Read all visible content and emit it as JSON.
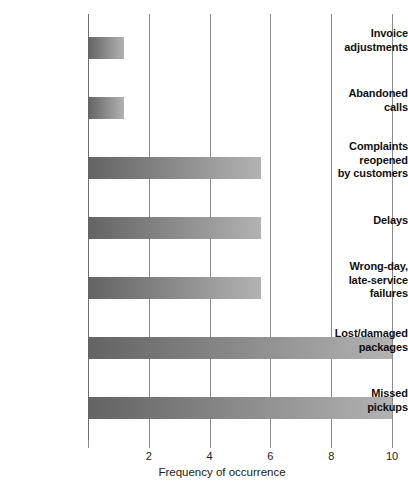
{
  "chart_data": {
    "type": "bar",
    "orientation": "horizontal",
    "title": "",
    "xlabel": "Frequency of occurrence",
    "ylabel": "",
    "xlim": [
      0,
      10
    ],
    "xticks": [
      2,
      4,
      6,
      8,
      10
    ],
    "xtick_labels": [
      "2",
      "4",
      "6",
      "8",
      "10"
    ],
    "grid": "vertical",
    "legend": "none",
    "categories": [
      "Invoice adjustments",
      "Abandoned calls",
      "Complaints reopened by customers",
      "Delays",
      "Wrong-day, late-service failures",
      "Lost/damaged packages",
      "Missed pickups"
    ],
    "category_lines": [
      [
        "Invoice",
        "adjustments"
      ],
      [
        "Abandoned",
        "calls"
      ],
      [
        "Complaints",
        "reopened",
        "by customers"
      ],
      [
        "Delays"
      ],
      [
        "Wrong-day,",
        "late-service",
        "failures"
      ],
      [
        "Lost/damaged",
        "packages"
      ],
      [
        "Missed",
        "pickups"
      ]
    ],
    "values": [
      1.2,
      1.2,
      5.7,
      5.7,
      5.7,
      10,
      10
    ],
    "bar_gradient_start": "#636363",
    "bar_gradient_end": "#b2b2b2",
    "grid_color": "#8a8a8a",
    "axis_color": "#6f6f6f",
    "text_color": "#1a1a1a"
  }
}
